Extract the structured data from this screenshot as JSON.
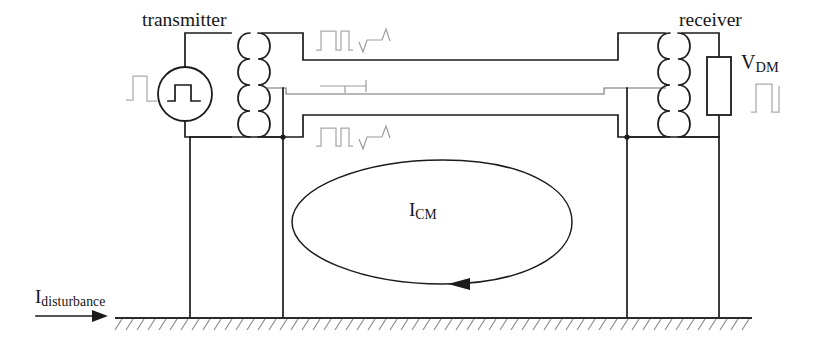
{
  "figure": {
    "type": "circuit-diagram",
    "title_visible": false,
    "background_color": "#ffffff",
    "line_color": "#1b1b1b",
    "faint_line_color": "#a9a9a9",
    "ground_hatch_color": "#8a8a8a"
  },
  "labels": {
    "transmitter": "transmitter",
    "receiver": "receiver",
    "vdm_main": "V",
    "vdm_sub": "DM",
    "icm_main": "I",
    "icm_sub": "CM",
    "idisturbance_main": "I",
    "idisturbance_sub": "disturbance"
  },
  "components": {
    "source": {
      "name": "square-wave-source",
      "center_x": 185,
      "center_y": 94,
      "radius": 27,
      "symbol": "square-wave"
    },
    "transformer_left": {
      "name": "transmitter-transformer",
      "windings_per_side": 4,
      "center_x": 253,
      "top_y": 33,
      "bottom_y": 137
    },
    "transformer_right": {
      "name": "receiver-transformer",
      "windings_per_side": 4,
      "center_x": 673,
      "top_y": 33,
      "bottom_y": 137
    },
    "load_resistor": {
      "name": "vdm-load-resistor",
      "x": 707,
      "y": 57,
      "width": 24,
      "height": 58
    },
    "common_mode_loop": {
      "name": "common-mode-current-loop",
      "center_x": 432,
      "center_y": 222,
      "radius_x": 140,
      "radius_y": 62,
      "direction": "counter-clockwise",
      "arrow_at": "bottom-center-left"
    },
    "ground_plane": {
      "name": "ground-plane",
      "line_y": 318,
      "x_start": 115,
      "x_end": 752,
      "hatch_count": 57
    }
  },
  "waveforms": [
    {
      "name": "top-line-square-wave",
      "kind": "square-pulse",
      "x": 318,
      "y": 29,
      "style": "faint"
    },
    {
      "name": "top-line-noise-spike",
      "kind": "noise-spike",
      "x": 362,
      "y": 31,
      "style": "faint"
    },
    {
      "name": "middle-line-glitch",
      "kind": "small-glitch",
      "x": 333,
      "y": 86,
      "style": "faint"
    },
    {
      "name": "bottom-line-square-wave",
      "kind": "square-pulse",
      "x": 318,
      "y": 126,
      "style": "faint"
    },
    {
      "name": "bottom-line-noise-spike",
      "kind": "noise-spike",
      "x": 362,
      "y": 128,
      "style": "faint"
    },
    {
      "name": "source-input-square-wave",
      "kind": "square-pulse",
      "x": 128,
      "y": 78,
      "style": "faint"
    },
    {
      "name": "vdm-output-square-wave",
      "kind": "square-pulse",
      "x": 752,
      "y": 84,
      "style": "faint"
    }
  ],
  "arrows": {
    "disturbance_arrow": {
      "name": "disturbance-current-arrow",
      "x_start": 36,
      "x_end": 100,
      "y": 316,
      "direction": "right"
    }
  }
}
